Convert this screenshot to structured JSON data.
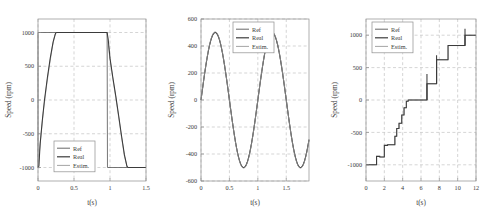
{
  "figure": {
    "background": "#ffffff",
    "panel_count": 3
  },
  "legend": {
    "entries": [
      {
        "key": "ref",
        "label": "Ref",
        "color": "#5f5f5f"
      },
      {
        "key": "real",
        "label": "Real",
        "color": "#3b3b3b"
      },
      {
        "key": "estim",
        "label": "Estim.",
        "color": "#9a9a9a"
      }
    ]
  },
  "chart_data": [
    {
      "id": "panel-1-trapezoid",
      "type": "line",
      "title": "",
      "xlabel": "t(s)",
      "ylabel": "Speed (rpm)",
      "xlim": [
        0,
        1.5
      ],
      "ylim": [
        -1200,
        1200
      ],
      "xticks": [
        0,
        0.5,
        1,
        1.5
      ],
      "xticklabels": [
        "0",
        "0.5",
        "1",
        "1.5"
      ],
      "yticks": [
        -1000,
        -500,
        0,
        500,
        1000
      ],
      "yticklabels": [
        "-1000",
        "-500",
        "0",
        "500",
        "1000"
      ],
      "grid": true,
      "legend_position": "lower-left",
      "series": [
        {
          "name": "Ref",
          "points": [
            [
              0,
              -1000
            ],
            [
              0.005,
              -1000
            ],
            [
              0.01,
              1000
            ],
            [
              1.5,
              1000
            ]
          ]
        },
        {
          "name": "Real",
          "points": [
            [
              0,
              -1000
            ],
            [
              0.012,
              -980
            ],
            [
              0.03,
              -650
            ],
            [
              0.06,
              -300
            ],
            [
              0.09,
              0
            ],
            [
              0.13,
              330
            ],
            [
              0.17,
              620
            ],
            [
              0.21,
              860
            ],
            [
              0.245,
              990
            ],
            [
              0.26,
              1000
            ],
            [
              0.5,
              1000
            ],
            [
              0.96,
              1000
            ],
            [
              0.975,
              900
            ],
            [
              1.0,
              620
            ],
            [
              1.04,
              330
            ],
            [
              1.08,
              60
            ],
            [
              1.12,
              -230
            ],
            [
              1.16,
              -530
            ],
            [
              1.2,
              -810
            ],
            [
              1.235,
              -980
            ],
            [
              1.25,
              -1000
            ],
            [
              1.5,
              -1000
            ]
          ]
        },
        {
          "name": "Estim.",
          "points": [
            [
              0,
              -1000
            ],
            [
              0.008,
              -1010
            ],
            [
              0.02,
              -760
            ],
            [
              0.05,
              -430
            ],
            [
              0.08,
              -120
            ],
            [
              0.12,
              220
            ],
            [
              0.16,
              520
            ],
            [
              0.2,
              790
            ],
            [
              0.235,
              970
            ],
            [
              0.25,
              1000
            ],
            [
              0.5,
              1000
            ],
            [
              0.955,
              1000
            ],
            [
              0.97,
              880
            ],
            [
              1.0,
              600
            ],
            [
              1.04,
              310
            ],
            [
              1.08,
              40
            ],
            [
              1.12,
              -250
            ],
            [
              1.16,
              -550
            ],
            [
              1.2,
              -830
            ],
            [
              1.24,
              -1000
            ],
            [
              1.26,
              -1000
            ],
            [
              1.5,
              -1000
            ]
          ]
        },
        {
          "name": "RefSquare",
          "points": [
            [
              0,
              -1000
            ],
            [
              0.0,
              1000
            ],
            [
              0.96,
              1000
            ],
            [
              0.965,
              -1000
            ],
            [
              1.5,
              -1000
            ]
          ]
        }
      ]
    },
    {
      "id": "panel-2-sine",
      "type": "line",
      "title": "",
      "xlabel": "t(s)",
      "ylabel": "Speed (rpm)",
      "xlim": [
        0,
        1.9
      ],
      "ylim": [
        -600,
        600
      ],
      "xticks": [
        0,
        0.5,
        1,
        1.5
      ],
      "xticklabels": [
        "0",
        "0.5",
        "1",
        "1.5"
      ],
      "yticks": [
        -600,
        -400,
        -200,
        0,
        200,
        400,
        600
      ],
      "yticklabels": [
        "-600",
        "-400",
        "-200",
        "0",
        "200",
        "400",
        "600"
      ],
      "grid": true,
      "legend_position": "upper-center",
      "sine": {
        "amplitude": 500,
        "period": 1.0,
        "phase": 0.0,
        "offset": 0
      },
      "series": [
        {
          "name": "Ref",
          "generator": "sine",
          "amplitude": 500,
          "period": 1.0
        },
        {
          "name": "Real",
          "generator": "sine",
          "amplitude": 500,
          "period": 1.0
        },
        {
          "name": "Estim.",
          "generator": "sine",
          "amplitude": 505,
          "period": 1.0
        }
      ]
    },
    {
      "id": "panel-3-staircase",
      "type": "line",
      "title": "",
      "xlabel": "t(s)",
      "ylabel": "Speed (rpm)",
      "xlim": [
        0,
        12
      ],
      "ylim": [
        -1250,
        1250
      ],
      "xticks": [
        0,
        2,
        4,
        6,
        8,
        10,
        12
      ],
      "xticklabels": [
        "0",
        "2",
        "4",
        "6",
        "8",
        "10",
        "12"
      ],
      "yticks": [
        -1000,
        -500,
        0,
        500,
        1000
      ],
      "yticklabels": [
        "-1000",
        "-500",
        "0",
        "500",
        "1000"
      ],
      "grid": true,
      "legend_position": "upper-left",
      "steps": [
        [
          0.0,
          -1000
        ],
        [
          1.15,
          -1000
        ],
        [
          1.15,
          -870
        ],
        [
          1.5,
          -870
        ],
        [
          1.5,
          -880
        ],
        [
          2.0,
          -880
        ],
        [
          2.0,
          -700
        ],
        [
          2.35,
          -700
        ],
        [
          2.35,
          -690
        ],
        [
          3.15,
          -690
        ],
        [
          3.15,
          -560
        ],
        [
          3.35,
          -560
        ],
        [
          3.35,
          -440
        ],
        [
          3.6,
          -440
        ],
        [
          3.6,
          -360
        ],
        [
          3.9,
          -360
        ],
        [
          3.9,
          -230
        ],
        [
          4.15,
          -230
        ],
        [
          4.15,
          -120
        ],
        [
          4.4,
          -120
        ],
        [
          4.4,
          -20
        ],
        [
          4.6,
          -20
        ],
        [
          4.6,
          0
        ],
        [
          6.65,
          0
        ],
        [
          6.65,
          250
        ],
        [
          7.7,
          250
        ],
        [
          7.7,
          620
        ],
        [
          8.95,
          620
        ],
        [
          8.95,
          840
        ],
        [
          10.8,
          840
        ],
        [
          10.8,
          1000
        ],
        [
          12.0,
          1000
        ]
      ],
      "spikes": [
        {
          "x": 1.15,
          "from": -1000,
          "to": -900
        },
        {
          "x": 6.65,
          "from": 0,
          "to": 400
        },
        {
          "x": 7.7,
          "from": 250,
          "to": 690
        },
        {
          "x": 10.8,
          "from": 840,
          "to": 1100
        }
      ]
    }
  ]
}
